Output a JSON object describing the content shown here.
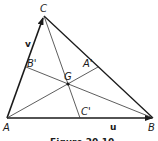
{
  "diagram": {
    "vertices": {
      "A": {
        "label": "A",
        "x": 7,
        "y": 118
      },
      "B": {
        "label": "B",
        "x": 153,
        "y": 118
      },
      "C": {
        "label": "C",
        "x": 44,
        "y": 16
      }
    },
    "midpoints": {
      "A_prime": {
        "label": "A'",
        "x": 98,
        "y": 67
      },
      "B_prime": {
        "label": "B'",
        "x": 26,
        "y": 67
      },
      "C_prime": {
        "label": "C'",
        "x": 80,
        "y": 118
      }
    },
    "centroid": {
      "label": "G",
      "x": 68,
      "y": 84
    },
    "vectors": {
      "u": {
        "label": "u"
      },
      "v": {
        "label": "v"
      }
    },
    "caption": "Figure 20.10"
  }
}
